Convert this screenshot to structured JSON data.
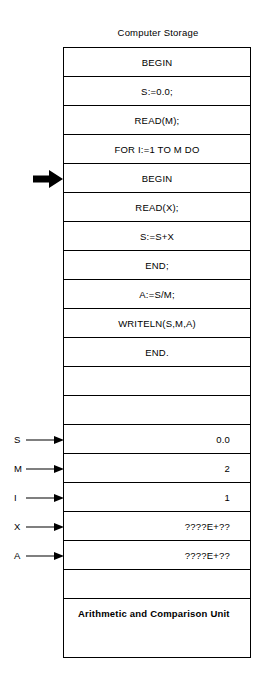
{
  "diagram": {
    "title": "Computer Storage",
    "pointer": {
      "name": "instruction-pointer-arrow",
      "target_row_index": 4
    },
    "rows": [
      {
        "type": "statement",
        "text": "BEGIN"
      },
      {
        "type": "statement",
        "text": "S:=0.0;"
      },
      {
        "type": "statement",
        "text": "READ(M);"
      },
      {
        "type": "statement",
        "text": "FOR I:=1 TO M DO"
      },
      {
        "type": "statement",
        "text": "BEGIN"
      },
      {
        "type": "statement",
        "text": "READ(X);"
      },
      {
        "type": "statement",
        "text": "S:=S+X"
      },
      {
        "type": "statement",
        "text": "END;"
      },
      {
        "type": "statement",
        "text": "A:=S/M;"
      },
      {
        "type": "statement",
        "text": "WRITELN(S,M,A)"
      },
      {
        "type": "statement",
        "text": "END."
      },
      {
        "type": "blank",
        "text": ""
      },
      {
        "type": "blank",
        "text": ""
      },
      {
        "type": "variable",
        "label": "S",
        "text": "0.0"
      },
      {
        "type": "variable",
        "label": "M",
        "text": "2"
      },
      {
        "type": "variable",
        "label": "I",
        "text": "1"
      },
      {
        "type": "variable",
        "label": "X",
        "text": "????E+??"
      },
      {
        "type": "variable",
        "label": "A",
        "text": "????E+??"
      },
      {
        "type": "blank",
        "text": ""
      },
      {
        "type": "unit",
        "text": "Arithmetic and Comparison Unit"
      }
    ]
  }
}
